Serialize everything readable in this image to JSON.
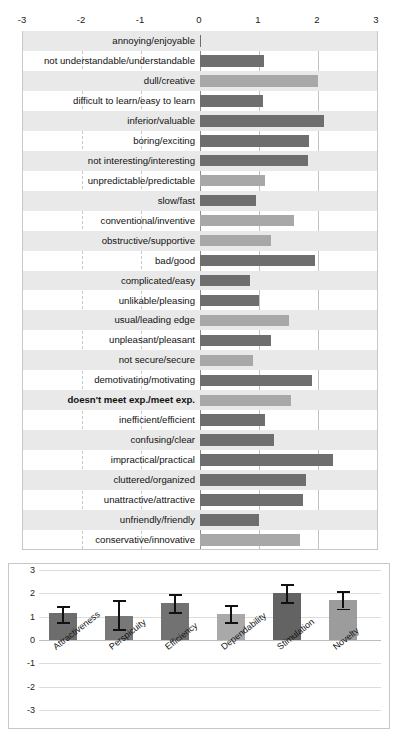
{
  "chart_data": [
    {
      "type": "bar",
      "orientation": "horizontal",
      "title": "",
      "xlabel": "",
      "ylabel": "",
      "xlim": [
        -3,
        3
      ],
      "xticks": [
        -3,
        -2,
        -1,
        0,
        1,
        2,
        3
      ],
      "xtick_labels": [
        "-3",
        "-2",
        "-1",
        "0",
        "1",
        "2",
        "3"
      ],
      "grid": true,
      "legend": "none",
      "categories": [
        "annoying/enjoyable",
        "not understandable/understandable",
        "dull/creative",
        "difficult to learn/easy to learn",
        "inferior/valuable",
        "boring/exciting",
        "not interesting/interesting",
        "unpredictable/predictable",
        "slow/fast",
        "conventional/inventive",
        "obstructive/supportive",
        "bad/good",
        "complicated/easy",
        "unlikable/pleasing",
        "usual/leading edge",
        "unpleasant/pleasant",
        "not secure/secure",
        "demotivating/motivating",
        "doesn't meet exp./meet exp.",
        "inefficient/efficient",
        "confusing/clear",
        "impractical/practical",
        "cluttered/organized",
        "unattractive/attractive",
        "unfriendly/friendly",
        "conservative/innovative"
      ],
      "values": [
        0.02,
        1.08,
        2.0,
        1.06,
        2.1,
        1.85,
        1.83,
        1.1,
        0.95,
        1.6,
        1.2,
        1.95,
        0.85,
        1.0,
        1.5,
        1.2,
        0.9,
        1.9,
        1.55,
        1.1,
        1.25,
        2.25,
        1.8,
        1.75,
        1.0,
        1.7
      ],
      "bar_shades": [
        "dark",
        "dark",
        "light",
        "dark",
        "dark",
        "dark",
        "dark",
        "light",
        "dark",
        "light",
        "light",
        "dark",
        "dark",
        "dark",
        "light",
        "dark",
        "light",
        "dark",
        "light",
        "dark",
        "dark",
        "dark",
        "dark",
        "dark",
        "dark",
        "light"
      ],
      "bold_rows": [
        18
      ]
    },
    {
      "type": "bar",
      "orientation": "vertical",
      "title": "",
      "xlabel": "",
      "ylabel": "",
      "ylim": [
        -3,
        3
      ],
      "yticks": [
        3,
        2,
        1,
        0,
        -1,
        -2,
        -3
      ],
      "ytick_labels": [
        "3",
        "2",
        "1",
        "0",
        "-1",
        "-2",
        "-3"
      ],
      "grid": true,
      "legend": "none",
      "categories": [
        "Attractiveness",
        "Perspicuity",
        "Efficiency",
        "Dependability",
        "Stimulation",
        "Novelty"
      ],
      "values": [
        1.15,
        1.02,
        1.57,
        1.13,
        2.02,
        1.71
      ],
      "error_low": [
        0.77,
        0.47,
        1.18,
        0.78,
        1.63,
        1.35
      ],
      "error_high": [
        1.45,
        1.7,
        1.97,
        1.49,
        2.38,
        2.08
      ]
    }
  ],
  "item_chart": {
    "axis_ticks": [
      "-3",
      "-2",
      "-1",
      "0",
      "1",
      "2",
      "3"
    ]
  },
  "scale_chart": {
    "y_ticks": [
      "3",
      "2",
      "1",
      "0",
      "-1",
      "-2",
      "-3"
    ]
  }
}
